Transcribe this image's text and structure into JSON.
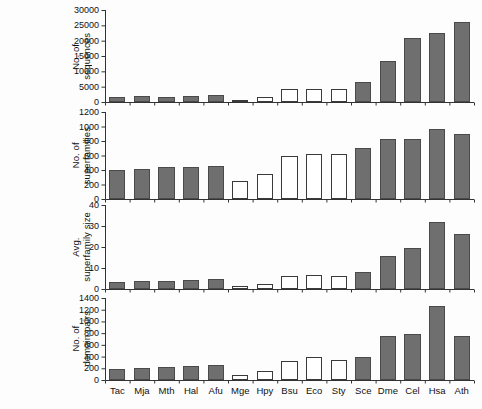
{
  "figure": {
    "title": "",
    "organisms": [
      "Tac",
      "Mja",
      "Mth",
      "Hal",
      "Afu",
      "Mge",
      "Hpy",
      "Bsu",
      "Eco",
      "Sty",
      "Sce",
      "Dme",
      "Cel",
      "Hsa",
      "Ath"
    ],
    "bar_styles": [
      "filled",
      "filled",
      "filled",
      "filled",
      "filled",
      "open",
      "open",
      "open",
      "open",
      "open",
      "filled",
      "filled",
      "filled",
      "filled",
      "filled"
    ],
    "colors": {
      "filled_fill": "#6f6f6f",
      "filled_stroke": "#4a4a4a",
      "open_fill": "#ffffff",
      "open_stroke": "#3a3a3a",
      "axis": "#333333",
      "text": "#111111",
      "background": "#fdfdfd"
    }
  },
  "chart_data": [
    {
      "type": "bar",
      "title": "",
      "xlabel": "",
      "ylabel": "No. of\nsequences",
      "categories": [
        "Tac",
        "Mja",
        "Mth",
        "Hal",
        "Afu",
        "Mge",
        "Hpy",
        "Bsu",
        "Eco",
        "Sty",
        "Sce",
        "Dme",
        "Cel",
        "Hsa",
        "Ath"
      ],
      "values": [
        1500,
        1800,
        1750,
        2000,
        2400,
        470,
        1550,
        4150,
        4250,
        4200,
        6400,
        13500,
        20800,
        22600,
        26000
      ],
      "ylim": [
        0,
        30000
      ],
      "yticks": [
        0,
        5000,
        10000,
        15000,
        20000,
        25000,
        30000
      ],
      "ytick_labels": [
        "0",
        "5000",
        "10000",
        "15000",
        "20000",
        "25000",
        "30000"
      ],
      "grid": false,
      "legend": "none"
    },
    {
      "type": "bar",
      "title": "",
      "xlabel": "",
      "ylabel": "No. of\nsuperfamilies",
      "categories": [
        "Tac",
        "Mja",
        "Mth",
        "Hal",
        "Afu",
        "Mge",
        "Hpy",
        "Bsu",
        "Eco",
        "Sty",
        "Sce",
        "Dme",
        "Cel",
        "Hsa",
        "Ath"
      ],
      "values": [
        405,
        410,
        435,
        445,
        460,
        250,
        345,
        590,
        620,
        615,
        700,
        830,
        830,
        960,
        890
      ],
      "ylim": [
        0,
        1200
      ],
      "yticks": [
        0,
        200,
        400,
        600,
        800,
        1000,
        1200
      ],
      "ytick_labels": [
        "0",
        "200",
        "400",
        "600",
        "800",
        "1000",
        "1200"
      ],
      "grid": false,
      "legend": "none"
    },
    {
      "type": "bar",
      "title": "",
      "xlabel": "",
      "ylabel": "Avg.\nsuperfamily size",
      "categories": [
        "Tac",
        "Mja",
        "Mth",
        "Hal",
        "Afu",
        "Mge",
        "Hpy",
        "Bsu",
        "Eco",
        "Sty",
        "Sce",
        "Dme",
        "Cel",
        "Hsa",
        "Ath"
      ],
      "values": [
        3.2,
        3.6,
        3.6,
        4.2,
        4.9,
        1.5,
        2.2,
        6.2,
        6.5,
        6.4,
        8.0,
        15.5,
        19.5,
        32.0,
        26.0
      ],
      "ylim": [
        0,
        40
      ],
      "yticks": [
        0,
        10,
        20,
        30,
        40
      ],
      "ytick_labels": [
        "0",
        "10",
        "20",
        "30",
        "40"
      ],
      "grid": false,
      "legend": "none"
    },
    {
      "type": "bar",
      "title": "",
      "xlabel": "",
      "ylabel": "No. of\ndomain pairs",
      "categories": [
        "Tac",
        "Mja",
        "Mth",
        "Hal",
        "Afu",
        "Mge",
        "Hpy",
        "Bsu",
        "Eco",
        "Sty",
        "Sce",
        "Dme",
        "Cel",
        "Hsa",
        "Ath"
      ],
      "values": [
        180,
        205,
        230,
        240,
        260,
        90,
        150,
        330,
        390,
        350,
        400,
        760,
        790,
        1270,
        760
      ],
      "ylim": [
        0,
        1400
      ],
      "yticks": [
        0,
        200,
        400,
        600,
        800,
        1000,
        1200,
        1400
      ],
      "ytick_labels": [
        "0",
        "200",
        "400",
        "600",
        "800",
        "1000",
        "1200",
        "1400"
      ],
      "grid": false,
      "legend": "none"
    }
  ]
}
